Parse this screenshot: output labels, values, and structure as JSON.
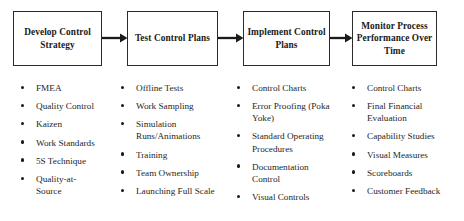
{
  "diagram": {
    "stages": [
      {
        "id": "develop-control-strategy",
        "label": "Develop Control Strategy"
      },
      {
        "id": "test-control-plans",
        "label": "Test Control Plans"
      },
      {
        "id": "implement-control-plans",
        "label": "Implement Control Plans"
      },
      {
        "id": "monitor-process-performance",
        "label": "Monitor Process Performance Over Time"
      }
    ],
    "arrows": [
      {
        "id": "arrow-1",
        "from": "develop-control-strategy",
        "to": "test-control-plans",
        "direction": "right"
      },
      {
        "id": "arrow-2",
        "from": "test-control-plans",
        "to": "implement-control-plans",
        "direction": "right"
      },
      {
        "id": "arrow-3",
        "from": "implement-control-plans",
        "to": "monitor-process-performance",
        "direction": "right"
      }
    ],
    "columns": [
      {
        "id": "column-develop-control-strategy",
        "items": [
          "FMEA",
          "Quality Control",
          "Kaizen",
          "Work Standards",
          "5S Technique",
          "Quality-at-Source"
        ]
      },
      {
        "id": "column-test-control-plans",
        "items": [
          "Offline Tests",
          "Work Sampling",
          "Simulation Runs/Animations",
          "Training",
          "Team Ownership",
          "Launching Full Scale"
        ]
      },
      {
        "id": "column-implement-control-plans",
        "items": [
          "Control Charts",
          "Error Proofing (Poka Yoke)",
          "Standard Operating Procedures",
          "Documentation Control",
          "Visual Controls"
        ]
      },
      {
        "id": "column-monitor-process-performance",
        "items": [
          "Control Charts",
          "Final Financial Evaluation",
          "Capability Studies",
          "Visual Measures",
          "Scoreboards",
          "Customer Feedback"
        ]
      }
    ],
    "colors": {
      "border": "#2b2b2b",
      "text": "#1a1a1a",
      "background": "#ffffff",
      "arrow": "#1a1a1a"
    }
  }
}
